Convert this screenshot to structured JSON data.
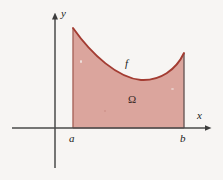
{
  "figure": {
    "background_color": "#f7f5f3",
    "axis_color": "#4a4a4a",
    "curve_color": "#a33c32",
    "fill_color": "#dba59d",
    "fill_edge_color": "#b86a60"
  },
  "axes": {
    "x_label": "x",
    "y_label": "y",
    "origin": {
      "x": 55,
      "y": 128
    },
    "x_axis": {
      "start_x": 12,
      "end_x": 212,
      "y": 128,
      "arrow": "right"
    },
    "y_axis": {
      "x": 55,
      "start_y": 168,
      "end_y": 12,
      "arrow": "up"
    }
  },
  "bounds": {
    "left_label": "a",
    "right_label": "b",
    "left_x": 73,
    "right_x": 184
  },
  "curve": {
    "label": "f",
    "left_peak": {
      "x": 73,
      "y": 28
    },
    "minimum": {
      "x": 141,
      "y": 80
    },
    "right_peak": {
      "x": 184,
      "y": 53
    },
    "path": "M 73 28 C 92 55, 118 78, 141 80 C 160 81, 176 70, 184 53"
  },
  "region": {
    "label": "Ω",
    "description": "Shaded area bounded above by f, below by the x-axis, left by x = a, right by x = b"
  }
}
